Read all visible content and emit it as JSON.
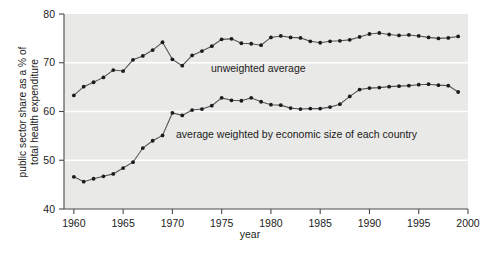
{
  "chart_data": {
    "type": "line",
    "title": "",
    "xlabel": "year",
    "ylabel": "public sector share as a % of total health expenditure",
    "xlim": [
      1959,
      2000
    ],
    "ylim": [
      40,
      80
    ],
    "xticks": [
      1960,
      1965,
      1970,
      1975,
      1980,
      1985,
      1990,
      1995,
      2000
    ],
    "yticks": [
      40,
      50,
      60,
      70,
      80
    ],
    "grid": "horizontal-white",
    "legend": "inline-annotations",
    "annotations": [
      {
        "text": "unweighted average",
        "x": 1974.5,
        "y": 71.2
      },
      {
        "text": "average weighted by economic size of each country",
        "x": 1974.0,
        "y": 56.6
      }
    ],
    "series": [
      {
        "name": "unweighted average",
        "x": [
          1960,
          1961,
          1962,
          1963,
          1964,
          1965,
          1966,
          1967,
          1968,
          1969,
          1970,
          1971,
          1972,
          1973,
          1974,
          1975,
          1976,
          1977,
          1978,
          1979,
          1980,
          1981,
          1982,
          1983,
          1984,
          1985,
          1986,
          1987,
          1988,
          1989,
          1990,
          1991,
          1992,
          1993,
          1994,
          1995,
          1996,
          1997,
          1998,
          1999
        ],
        "values": [
          63.3,
          65.1,
          66.0,
          67.0,
          68.5,
          68.3,
          70.6,
          71.4,
          72.6,
          74.2,
          70.7,
          69.4,
          71.5,
          72.4,
          73.4,
          74.8,
          74.9,
          74.0,
          73.9,
          73.6,
          75.2,
          75.5,
          75.2,
          75.1,
          74.4,
          74.1,
          74.4,
          74.5,
          74.7,
          75.3,
          75.9,
          76.1,
          75.8,
          75.6,
          75.7,
          75.5,
          75.2,
          75.0,
          75.1,
          75.4
        ]
      },
      {
        "name": "average weighted by economic size of each country",
        "x": [
          1960,
          1961,
          1962,
          1963,
          1964,
          1965,
          1966,
          1967,
          1968,
          1969,
          1970,
          1971,
          1972,
          1973,
          1974,
          1975,
          1976,
          1977,
          1978,
          1979,
          1980,
          1981,
          1982,
          1983,
          1984,
          1985,
          1986,
          1987,
          1988,
          1989,
          1990,
          1991,
          1992,
          1993,
          1994,
          1995,
          1996,
          1997,
          1998,
          1999
        ],
        "values": [
          46.6,
          45.6,
          46.2,
          46.7,
          47.2,
          48.4,
          49.6,
          52.5,
          54.0,
          55.1,
          59.7,
          59.2,
          60.3,
          60.5,
          61.2,
          62.8,
          62.3,
          62.2,
          62.8,
          62.0,
          61.4,
          61.3,
          60.7,
          60.5,
          60.6,
          60.6,
          60.9,
          61.5,
          63.1,
          64.5,
          64.8,
          64.9,
          65.1,
          65.2,
          65.3,
          65.5,
          65.6,
          65.4,
          65.3,
          64.0
        ]
      }
    ]
  },
  "labels": {
    "x_axis_title": "year",
    "y_axis_title_line1": "public sector share as a % of",
    "y_axis_title_line2": "total health expenditure",
    "annotation_unweighted": "unweighted average",
    "annotation_weighted": "average weighted by economic size of each country",
    "xtick_1960": "1960",
    "xtick_1965": "1965",
    "xtick_1970": "1970",
    "xtick_1975": "1975",
    "xtick_1980": "1980",
    "xtick_1985": "1985",
    "xtick_1990": "1990",
    "xtick_1995": "1995",
    "xtick_2000": "2000",
    "ytick_40": "40",
    "ytick_50": "50",
    "ytick_60": "60",
    "ytick_70": "70",
    "ytick_80": "80"
  },
  "colors": {
    "plot_background": "#e9e9e7",
    "gridline": "#ffffff",
    "axis": "#4a4a4a",
    "line": "#555555",
    "marker": "#1b1b1b",
    "text": "#1b1b1b",
    "page_background": "#ffffff"
  }
}
